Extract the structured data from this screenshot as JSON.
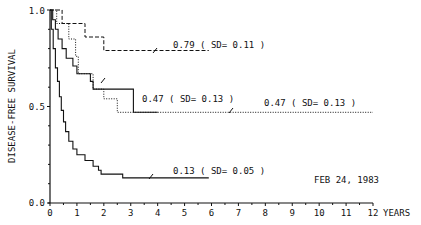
{
  "chart_data": {
    "type": "line",
    "subtype": "kaplan-meier step",
    "title": "",
    "xlabel": "YEARS",
    "ylabel": "DISEASE-FREE SURVIVAL",
    "xlim": [
      0,
      12
    ],
    "ylim": [
      0.0,
      1.0
    ],
    "x_ticks": [
      "0",
      "1",
      "2",
      "3",
      "4",
      "5",
      "6",
      "7",
      "8",
      "9",
      "10",
      "11",
      "12"
    ],
    "y_ticks": [
      "0.0",
      "0.5",
      "1.0"
    ],
    "grid": false,
    "date_annotation": "FEB 24, 1983",
    "series": [
      {
        "name": "curve-dashed",
        "style": "dashed",
        "annotation": "0.79 ( SD= 0.11 )",
        "final_value": 0.79,
        "sd": 0.11,
        "points": [
          [
            0,
            1.0
          ],
          [
            0.45,
            1.0
          ],
          [
            0.45,
            0.93
          ],
          [
            1.3,
            0.93
          ],
          [
            1.3,
            0.86
          ],
          [
            2.0,
            0.86
          ],
          [
            2.0,
            0.79
          ],
          [
            5.9,
            0.79
          ]
        ]
      },
      {
        "name": "curve-solid-upper",
        "style": "solid",
        "annotation": "0.47 ( SD= 0.13 )",
        "final_value": 0.47,
        "sd": 0.13,
        "points": [
          [
            0,
            1.0
          ],
          [
            0.1,
            1.0
          ],
          [
            0.1,
            0.95
          ],
          [
            0.2,
            0.95
          ],
          [
            0.2,
            0.9
          ],
          [
            0.3,
            0.9
          ],
          [
            0.3,
            0.85
          ],
          [
            0.45,
            0.85
          ],
          [
            0.45,
            0.8
          ],
          [
            0.6,
            0.8
          ],
          [
            0.6,
            0.75
          ],
          [
            0.85,
            0.75
          ],
          [
            0.85,
            0.71
          ],
          [
            1.0,
            0.71
          ],
          [
            1.0,
            0.67
          ],
          [
            1.5,
            0.67
          ],
          [
            1.5,
            0.63
          ],
          [
            1.6,
            0.63
          ],
          [
            1.6,
            0.59
          ],
          [
            3.1,
            0.59
          ],
          [
            3.1,
            0.47
          ],
          [
            4.0,
            0.47
          ]
        ]
      },
      {
        "name": "curve-dotted",
        "style": "dotted",
        "annotation": "0.47 ( SD= 0.13 )",
        "final_value": 0.47,
        "sd": 0.13,
        "points": [
          [
            0,
            1.0
          ],
          [
            0.25,
            1.0
          ],
          [
            0.25,
            0.93
          ],
          [
            0.7,
            0.93
          ],
          [
            0.7,
            0.85
          ],
          [
            0.95,
            0.85
          ],
          [
            0.95,
            0.76
          ],
          [
            1.05,
            0.76
          ],
          [
            1.05,
            0.67
          ],
          [
            1.6,
            0.67
          ],
          [
            1.6,
            0.59
          ],
          [
            2.0,
            0.59
          ],
          [
            2.0,
            0.54
          ],
          [
            2.5,
            0.54
          ],
          [
            2.5,
            0.47
          ],
          [
            12.0,
            0.47
          ]
        ]
      },
      {
        "name": "curve-solid-lower",
        "style": "solid",
        "annotation": "0.13 ( SD= 0.05 )",
        "final_value": 0.13,
        "sd": 0.05,
        "points": [
          [
            0,
            1.0
          ],
          [
            0.05,
            1.0
          ],
          [
            0.05,
            0.9
          ],
          [
            0.12,
            0.9
          ],
          [
            0.12,
            0.8
          ],
          [
            0.2,
            0.8
          ],
          [
            0.2,
            0.7
          ],
          [
            0.28,
            0.7
          ],
          [
            0.28,
            0.63
          ],
          [
            0.35,
            0.63
          ],
          [
            0.35,
            0.55
          ],
          [
            0.42,
            0.55
          ],
          [
            0.42,
            0.48
          ],
          [
            0.5,
            0.48
          ],
          [
            0.5,
            0.42
          ],
          [
            0.58,
            0.42
          ],
          [
            0.58,
            0.37
          ],
          [
            0.7,
            0.37
          ],
          [
            0.7,
            0.32
          ],
          [
            0.85,
            0.32
          ],
          [
            0.85,
            0.28
          ],
          [
            1.0,
            0.28
          ],
          [
            1.0,
            0.25
          ],
          [
            1.3,
            0.25
          ],
          [
            1.3,
            0.22
          ],
          [
            1.6,
            0.22
          ],
          [
            1.6,
            0.19
          ],
          [
            1.8,
            0.19
          ],
          [
            1.8,
            0.17
          ],
          [
            1.9,
            0.17
          ],
          [
            1.9,
            0.15
          ],
          [
            2.7,
            0.15
          ],
          [
            2.7,
            0.13
          ],
          [
            5.9,
            0.13
          ]
        ]
      }
    ]
  },
  "labels": {
    "ylabel": "DISEASE-FREE SURVIVAL",
    "xlabel": "YEARS",
    "date": "FEB 24, 1983",
    "ann_079": "0.79 ( SD= 0.11 )",
    "ann_047a": "0.47 ( SD= 0.13 )",
    "ann_047b": "0.47 ( SD= 0.13 )",
    "ann_013": "0.13 ( SD= 0.05 )",
    "y_tick_0": "0.0",
    "y_tick_05": "0.5",
    "y_tick_1": "1.0",
    "x_ticks": [
      "0",
      "1",
      "2",
      "3",
      "4",
      "5",
      "6",
      "7",
      "8",
      "9",
      "10",
      "11",
      "12"
    ]
  }
}
